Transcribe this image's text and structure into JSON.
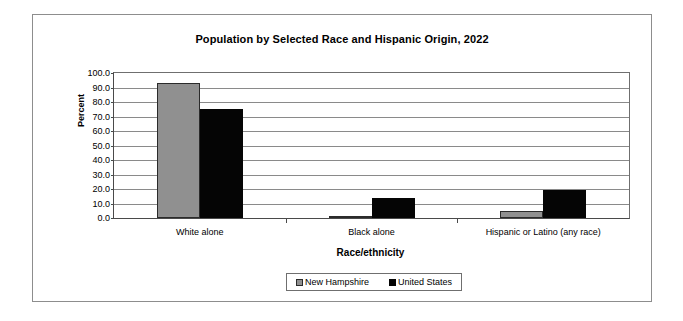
{
  "chart_data": {
    "type": "bar",
    "title": "Population by Selected Race and Hispanic Origin, 2022",
    "xlabel": "Race/ethnicity",
    "ylabel": "Percent",
    "categories": [
      "White alone",
      "Black alone",
      "Hispanic or Latino (any race)"
    ],
    "series": [
      {
        "name": "New Hampshire",
        "color": "#909090",
        "values": [
          93.0,
          1.5,
          4.5
        ]
      },
      {
        "name": "United States",
        "color": "#050505",
        "values": [
          75.5,
          13.6,
          19.1
        ]
      }
    ],
    "ylim": [
      0,
      100
    ],
    "ytick_labels": [
      "100.0",
      "90.0",
      "80.0",
      "70.0",
      "60.0",
      "50.0",
      "40.0",
      "30.0",
      "20.0",
      "10.0",
      "0.0"
    ],
    "ytick_values": [
      100,
      90,
      80,
      70,
      60,
      50,
      40,
      30,
      20,
      10,
      0
    ],
    "grid": true,
    "legend_position": "bottom-center"
  }
}
